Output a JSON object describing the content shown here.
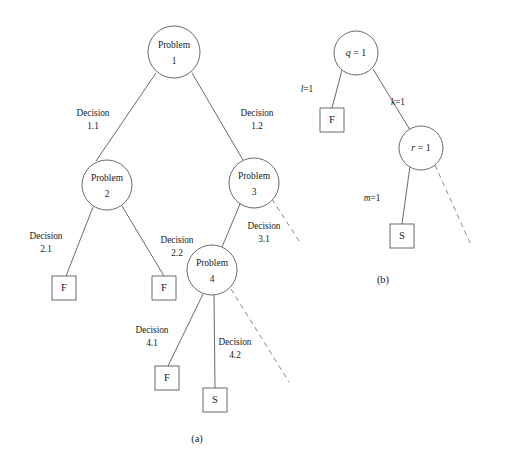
{
  "figure": {
    "width": 509,
    "height": 464,
    "background_color": "#ffffff",
    "stroke_color": "#5a5a5a",
    "text_color": "#1a1a1a"
  },
  "panel_a": {
    "caption": "(a)",
    "nodes": {
      "problem1": {
        "line1": "Problem",
        "line2": "1",
        "cx": 174,
        "cy": 52,
        "r": 26
      },
      "problem2": {
        "line1": "Problem",
        "line2": "2",
        "cx": 107,
        "cy": 185,
        "r": 25
      },
      "problem3": {
        "line1": "Problem",
        "line2": "3",
        "cx": 254,
        "cy": 183,
        "r": 25
      },
      "problem4": {
        "line1": "Problem",
        "line2": "4",
        "cx": 212,
        "cy": 270,
        "r": 25
      },
      "terminal_f_21": {
        "label": "F",
        "x": 52,
        "y": 276,
        "w": 24,
        "h": 24
      },
      "terminal_f_22": {
        "label": "F",
        "x": 152,
        "y": 276,
        "w": 24,
        "h": 24
      },
      "terminal_f_41": {
        "label": "F",
        "x": 155,
        "y": 366,
        "w": 24,
        "h": 24
      },
      "terminal_s_42": {
        "label": "S",
        "x": 203,
        "y": 388,
        "w": 24,
        "h": 24
      }
    },
    "edge_labels": {
      "d11": {
        "line1": "Decision",
        "line2": "1.1",
        "x": 93,
        "y": 113
      },
      "d12": {
        "line1": "Decision",
        "line2": "1.2",
        "x": 257,
        "y": 113
      },
      "d21": {
        "line1": "Decision",
        "line2": "2.1",
        "x": 46,
        "y": 236
      },
      "d22": {
        "line1": "Decision",
        "line2": "2.2",
        "x": 177,
        "y": 240
      },
      "d31": {
        "line1": "Decision",
        "line2": "3.1",
        "x": 264,
        "y": 226
      },
      "d41": {
        "line1": "Decision",
        "line2": "4.1",
        "x": 152,
        "y": 330
      },
      "d42": {
        "line1": "Decision",
        "line2": "4.2",
        "x": 235,
        "y": 342
      }
    }
  },
  "panel_b": {
    "caption": "(b)",
    "nodes": {
      "node_q": {
        "var": "q",
        "rel": " = ",
        "val": "1",
        "cx": 356,
        "cy": 53,
        "r": 22
      },
      "node_r": {
        "var": "r",
        "rel": " = ",
        "val": "1",
        "cx": 421,
        "cy": 148,
        "r": 22
      },
      "terminal_f": {
        "label": "F",
        "x": 320,
        "y": 108,
        "w": 24,
        "h": 24
      },
      "terminal_s": {
        "label": "S",
        "x": 390,
        "y": 224,
        "w": 24,
        "h": 24
      }
    },
    "edge_labels": {
      "l1": {
        "var": "l",
        "rel": "=",
        "val": "1",
        "x": 307,
        "y": 89
      },
      "k1": {
        "var": "k",
        "rel": "=",
        "val": "1",
        "x": 398,
        "y": 102
      },
      "m1": {
        "var": "m",
        "rel": "=",
        "val": "1",
        "x": 372,
        "y": 198
      }
    }
  }
}
